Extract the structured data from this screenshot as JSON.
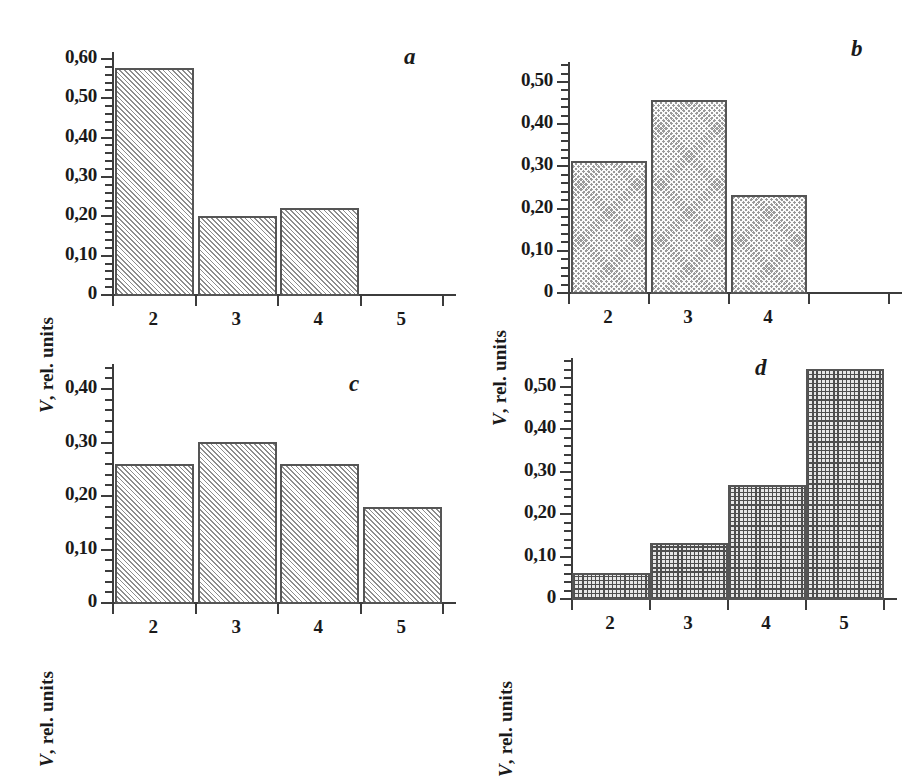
{
  "figure": {
    "decimal_separator": ",",
    "axis_color": "#3c3c3c",
    "bar_outline_color": "#555555",
    "background": "#ffffff"
  },
  "chart_data": [
    {
      "type": "bar",
      "panel": "a",
      "panel_label": "a",
      "title": "",
      "xlabel": "",
      "ylabel": "V, rel. units",
      "ylabel_symbol": "V",
      "ylabel_rest": ", rel. units",
      "categories": [
        "2",
        "3",
        "4",
        "5"
      ],
      "values": [
        0.575,
        0.197,
        0.218,
        0.0
      ],
      "ylim": [
        0,
        0.615
      ],
      "ytick_values": [
        0,
        0.1,
        0.2,
        0.3,
        0.4,
        0.5,
        0.6
      ],
      "ytick_labels": [
        "0",
        "0,10",
        "0,20",
        "0,30",
        "0,40",
        "0,50",
        "0,60"
      ],
      "yminor_step": 0.02,
      "fill_pattern": "diagonal-hatch",
      "grid": false,
      "legend": "none"
    },
    {
      "type": "bar",
      "panel": "b",
      "panel_label": "b",
      "title": "",
      "xlabel": "",
      "ylabel": "V, rel. units",
      "ylabel_symbol": "V",
      "ylabel_rest": ", rel. units",
      "categories": [
        "2",
        "3",
        "4",
        ""
      ],
      "values": [
        0.31,
        0.455,
        0.23,
        0.0
      ],
      "ylim": [
        0,
        0.545
      ],
      "ytick_values": [
        0,
        0.1,
        0.2,
        0.3,
        0.4,
        0.5
      ],
      "ytick_labels": [
        "0",
        "0,10",
        "0,20",
        "0,30",
        "0,40",
        "0,50"
      ],
      "yminor_step": 0.02,
      "fill_pattern": "checker-crosshatch",
      "grid": false,
      "legend": "none"
    },
    {
      "type": "bar",
      "panel": "c",
      "panel_label": "c",
      "title": "",
      "xlabel": "",
      "ylabel": "V, rel. units",
      "ylabel_symbol": "V",
      "ylabel_rest": ", rel. units",
      "categories": [
        "2",
        "3",
        "4",
        "5"
      ],
      "values": [
        0.258,
        0.3,
        0.258,
        0.177
      ],
      "ylim": [
        0,
        0.445
      ],
      "ytick_values": [
        0,
        0.1,
        0.2,
        0.3,
        0.4
      ],
      "ytick_labels": [
        "0",
        "0,10",
        "0,20",
        "0,30",
        "0,40"
      ],
      "yminor_step": 0.02,
      "fill_pattern": "diagonal-hatch",
      "grid": false,
      "legend": "none"
    },
    {
      "type": "bar",
      "panel": "d",
      "panel_label": "d",
      "title": "",
      "xlabel": "",
      "ylabel": "V, rel. units",
      "ylabel_symbol": "V",
      "ylabel_rest": ", rel. units",
      "categories": [
        "2",
        "3",
        "4",
        "5"
      ],
      "values": [
        0.06,
        0.13,
        0.267,
        0.54
      ],
      "ylim": [
        0,
        0.565
      ],
      "ytick_values": [
        0,
        0.1,
        0.2,
        0.3,
        0.4,
        0.5
      ],
      "ytick_labels": [
        "0",
        "0,10",
        "0,20",
        "0,30",
        "0,40",
        "0,50"
      ],
      "yminor_step": 0.02,
      "fill_pattern": "fine-grid",
      "grid": false,
      "legend": "none"
    }
  ]
}
